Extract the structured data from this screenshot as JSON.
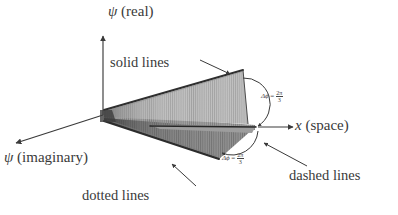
{
  "figure": {
    "background": "#ffffff",
    "ink": "#3a3a3a"
  },
  "axes": {
    "vertical": {
      "label_var": "ψ",
      "label_paren": "(real)",
      "name": "psi-real-axis"
    },
    "depth": {
      "label_var": "ψ",
      "label_paren": "(imaginary)",
      "name": "psi-imaginary-axis"
    },
    "horizontal": {
      "label_var": "x",
      "label_paren": "(space)",
      "name": "x-space-axis"
    }
  },
  "callouts": [
    {
      "id": "solid",
      "label": "solid lines"
    },
    {
      "id": "dotted",
      "label": "dotted lines"
    },
    {
      "id": "dashed",
      "label": "dashed lines"
    }
  ],
  "angles": [
    {
      "id": "upper",
      "symbol": "Δϕ",
      "equals": "=",
      "numerator": "2π",
      "denominator": "3",
      "text": "Δϕ = 2π/3"
    },
    {
      "id": "lower",
      "symbol": "Δϕ",
      "equals": "=",
      "numerator": "2π",
      "denominator": "3",
      "text": "Δϕ = 2π/3"
    }
  ],
  "surface": {
    "blade_count": 3,
    "shading": {
      "upper_blade": "#b4b4b4",
      "upper_edge": "#3c3c3c",
      "mid_blade": "#8c8c8c",
      "lower_blade": "#6e6e6e",
      "dark_edge": "#2c2c2c"
    }
  }
}
